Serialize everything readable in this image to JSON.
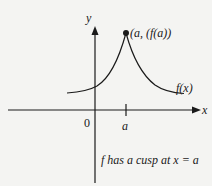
{
  "diagram": {
    "axes": {
      "x_label": "x",
      "y_label": "y",
      "origin_label": "0"
    },
    "tick": {
      "label": "a"
    },
    "point": {
      "label": "(a, (f(a))"
    },
    "curve": {
      "label": "f(x)"
    },
    "caption": "f has a cusp at x = a",
    "colors": {
      "ink": "#1a1a1a",
      "background": "#f4f4f2"
    }
  }
}
